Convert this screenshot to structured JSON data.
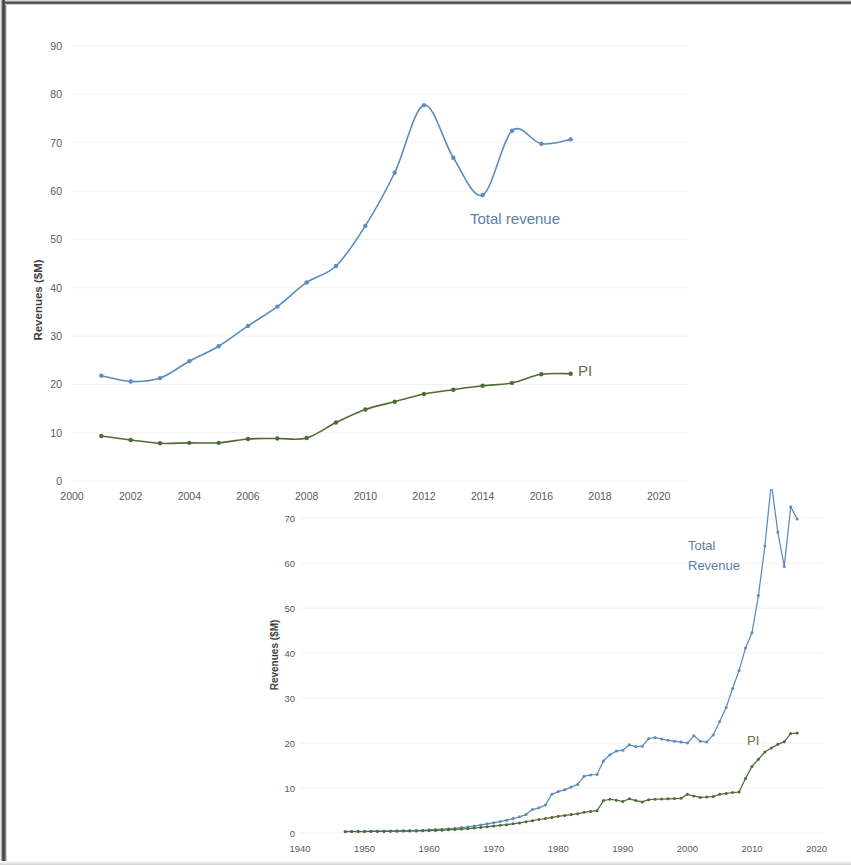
{
  "figure": {
    "background": "#ffffff",
    "blue_color": "#5b8cbe",
    "green_color": "#4f6b35"
  },
  "chart_data": [
    {
      "id": "top-chart",
      "type": "line",
      "title": "",
      "xlabel": "",
      "ylabel": "Revenues ($M)",
      "xlim": [
        2000,
        2021
      ],
      "ylim": [
        0,
        95
      ],
      "xticks": [
        "2000",
        "2002",
        "2004",
        "2006",
        "2008",
        "2010",
        "2012",
        "2014",
        "2016",
        "2018",
        "2020"
      ],
      "yticks": [
        "0",
        "10",
        "20",
        "30",
        "40",
        "50",
        "60",
        "70",
        "80",
        "90"
      ],
      "grid": "faint-horizontal",
      "legend_position": "inline-annotation",
      "markers": true,
      "x": [
        2001,
        2002,
        2003,
        2004,
        2005,
        2006,
        2007,
        2008,
        2009,
        2010,
        2011,
        2012,
        2013,
        2014,
        2015,
        2016,
        2017
      ],
      "series": [
        {
          "name": "Total revenue",
          "color": "#5b8cbe",
          "label": "Total revenue",
          "values": [
            21.8,
            20.6,
            21.3,
            24.8,
            27.9,
            32.1,
            36.1,
            41.1,
            44.5,
            52.8,
            63.8,
            77.8,
            66.9,
            59.2,
            72.5,
            69.8,
            70.7
          ]
        },
        {
          "name": "PI",
          "color": "#4f6b35",
          "label": "PI",
          "values": [
            9.3,
            8.5,
            7.8,
            7.9,
            7.9,
            8.7,
            8.8,
            8.9,
            12.1,
            14.8,
            16.4,
            18.0,
            18.9,
            19.7,
            20.3,
            22.1,
            22.2
          ]
        }
      ]
    },
    {
      "id": "bottom-chart",
      "type": "line",
      "title": "",
      "xlabel": "",
      "ylabel": "Revenues ($M)",
      "xlim": [
        1940,
        2021
      ],
      "ylim": [
        0,
        74
      ],
      "xticks": [
        "1940",
        "1950",
        "1960",
        "1970",
        "1980",
        "1990",
        "2000",
        "2010",
        "2020"
      ],
      "yticks": [
        "0",
        "10",
        "20",
        "30",
        "40",
        "50",
        "60",
        "70"
      ],
      "grid": "faint-horizontal",
      "legend_position": "inline-annotation",
      "markers": true,
      "x": [
        1947,
        1948,
        1949,
        1950,
        1951,
        1952,
        1953,
        1954,
        1955,
        1956,
        1957,
        1958,
        1959,
        1960,
        1961,
        1962,
        1963,
        1964,
        1965,
        1966,
        1967,
        1968,
        1969,
        1970,
        1971,
        1972,
        1973,
        1974,
        1975,
        1976,
        1977,
        1978,
        1979,
        1980,
        1981,
        1982,
        1983,
        1984,
        1985,
        1986,
        1987,
        1988,
        1989,
        1990,
        1991,
        1992,
        1993,
        1994,
        1995,
        1996,
        1997,
        1998,
        1999,
        2000,
        2001,
        2002,
        2003,
        2004,
        2005,
        2006,
        2007,
        2008,
        2009,
        2010,
        2011,
        2012,
        2013,
        2014,
        2015,
        2016,
        2017
      ],
      "series": [
        {
          "name": "Total Revenue",
          "color": "#5b8cbe",
          "label_line1": "Total",
          "label_line2": "Revenue",
          "values": [
            0.35,
            0.36,
            0.37,
            0.38,
            0.4,
            0.42,
            0.43,
            0.45,
            0.48,
            0.52,
            0.55,
            0.58,
            0.62,
            0.7,
            0.78,
            0.86,
            0.95,
            1.05,
            1.2,
            1.35,
            1.55,
            1.8,
            2.05,
            2.3,
            2.55,
            2.85,
            3.2,
            3.6,
            4.1,
            5.2,
            5.6,
            6.2,
            8.6,
            9.2,
            9.6,
            10.2,
            10.8,
            12.6,
            12.9,
            13.0,
            16.0,
            17.4,
            18.2,
            18.4,
            19.6,
            19.2,
            19.3,
            21.0,
            21.2,
            20.9,
            20.6,
            20.4,
            20.2,
            20.0,
            21.6,
            20.4,
            20.2,
            21.8,
            24.8,
            27.9,
            32.1,
            36.1,
            41.1,
            44.5,
            52.8,
            63.8,
            77.8,
            66.9,
            59.2,
            72.5,
            69.8
          ]
        },
        {
          "name": "PI",
          "color": "#4f6b35",
          "label": "PI",
          "values": [
            0.3,
            0.31,
            0.32,
            0.33,
            0.34,
            0.35,
            0.36,
            0.38,
            0.4,
            0.42,
            0.44,
            0.46,
            0.49,
            0.53,
            0.58,
            0.63,
            0.7,
            0.78,
            0.88,
            0.98,
            1.1,
            1.25,
            1.4,
            1.55,
            1.7,
            1.85,
            2.05,
            2.25,
            2.5,
            2.75,
            3.0,
            3.2,
            3.45,
            3.7,
            3.9,
            4.1,
            4.3,
            4.6,
            4.8,
            4.95,
            7.2,
            7.5,
            7.3,
            7.0,
            7.6,
            7.2,
            6.9,
            7.4,
            7.5,
            7.55,
            7.6,
            7.65,
            7.7,
            8.6,
            8.2,
            7.9,
            8.0,
            8.1,
            8.6,
            8.8,
            9.0,
            9.1,
            12.1,
            14.8,
            16.4,
            18.0,
            18.9,
            19.7,
            20.3,
            22.1,
            22.2
          ]
        }
      ]
    }
  ]
}
